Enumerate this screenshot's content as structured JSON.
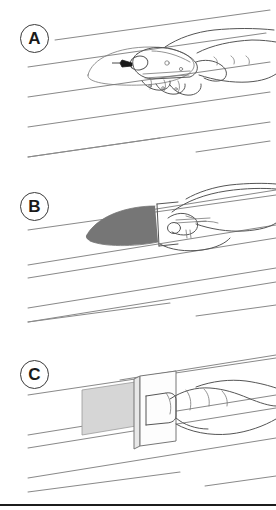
{
  "figure": {
    "width": 276,
    "height": 510,
    "background_color": "#ffffff",
    "line_color": "#8a8a8a",
    "ink_color": "#4a4a4a",
    "footer_rule_color": "#1c1c1c"
  },
  "panels": [
    {
      "id": "panel-a",
      "label": "A",
      "caption": "Hand holding a utility knife cutting an oval outline on the lap siding board",
      "elements": {
        "oval_outline_color": "#8a8a8a",
        "blade_color": "#1a1a1a",
        "tool": "utility-knife"
      }
    },
    {
      "id": "panel-b",
      "label": "B",
      "caption": "Hand with scraper removing the shaded oval patch area from the siding board",
      "elements": {
        "patch_fill_color": "#767676",
        "patch_shape": "ellipse",
        "tool": "scraper"
      }
    },
    {
      "id": "panel-c",
      "label": "C",
      "caption": "Hand pressing the replacement patch panel into the opening on the siding board",
      "elements": {
        "patch_fill_color": "#d6d6d6",
        "panel_fill_color": "#fcfcfc",
        "panel_edge_color": "#8a8a8a",
        "tool": "hand-press"
      }
    }
  ],
  "siding": {
    "description": "Diagonal clapboard / lap siding course lines running up to the right",
    "course_count_per_panel": 3
  }
}
